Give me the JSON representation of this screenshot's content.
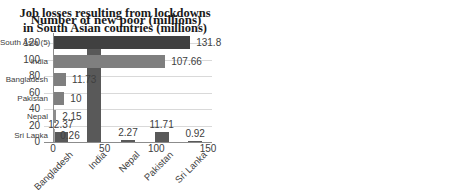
{
  "chart_data": [
    {
      "type": "bar",
      "orientation": "vertical",
      "title": "Job losses resulting from lockdowns in South Asian countries (millions)",
      "title_lines": [
        "Job losses resulting from lockdowns",
        "in South Asian countries (millions)"
      ],
      "categories": [
        "Bangladesh",
        "India",
        "Nepal",
        "Pakistan",
        "Sri Lanka"
      ],
      "values": [
        12.37,
        112.8,
        2.27,
        11.71,
        0.92
      ],
      "data_labels": [
        "12.37",
        "112.8",
        "2.27",
        "11.71",
        "0.92"
      ],
      "ylim": [
        0,
        120
      ],
      "yticks": [
        0,
        20,
        40,
        60,
        80,
        100,
        120
      ],
      "grid": true,
      "legend": "none",
      "bar_color": "#595959",
      "xlabel": "",
      "ylabel": ""
    },
    {
      "type": "bar",
      "orientation": "horizontal",
      "title": "Number of new poor (millions)",
      "categories": [
        "South Asia (5)",
        "India",
        "Bangladesh",
        "Pakistan",
        "Nepal",
        "Sri Lanka"
      ],
      "values": [
        131.8,
        107.66,
        11.73,
        10,
        2.15,
        0.26
      ],
      "data_labels": [
        "131.8",
        "107.66",
        "11.73",
        "10",
        "2.15",
        "0.26"
      ],
      "xlim": [
        0,
        150
      ],
      "xticks": [
        0,
        50,
        100,
        150
      ],
      "grid": false,
      "legend": "none",
      "bar_colors": [
        "#404040",
        "#7f7f7f",
        "#7f7f7f",
        "#7f7f7f",
        "#8c8c8c",
        "#a6a6a6"
      ],
      "xlabel": "",
      "ylabel": ""
    }
  ],
  "colors": {
    "grid": "#d9d9d9",
    "axis": "#8c8c8c",
    "text": "#404040",
    "title": "#1a1a1a",
    "background": "#ffffff"
  }
}
